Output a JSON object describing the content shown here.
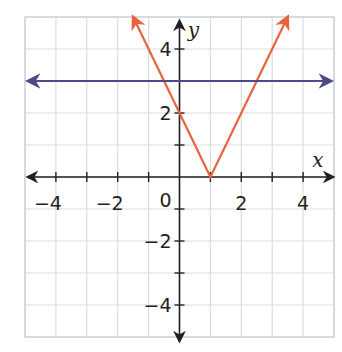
{
  "chart_data": {
    "type": "line",
    "title": "",
    "xlabel": "x",
    "ylabel": "y",
    "xlim": [
      -5,
      5
    ],
    "ylim": [
      -5,
      5
    ],
    "grid": true,
    "x_tick_labels": [
      {
        "value": -4,
        "label": "−4"
      },
      {
        "value": -2,
        "label": "−2"
      },
      {
        "value": 2,
        "label": "2"
      },
      {
        "value": 4,
        "label": "4"
      }
    ],
    "y_tick_labels": [
      {
        "value": 4,
        "label": "4"
      },
      {
        "value": 2,
        "label": "2"
      },
      {
        "value": -2,
        "label": "−2"
      },
      {
        "value": -4,
        "label": "−4"
      }
    ],
    "origin_label": "0",
    "series": [
      {
        "name": "y = 2|x - 1|",
        "kind": "absolute-value",
        "color": "#e8643a",
        "points": [
          [
            -1.5,
            5
          ],
          [
            1,
            0
          ],
          [
            3.5,
            5
          ]
        ],
        "arrows": [
          "start",
          "end"
        ]
      },
      {
        "name": "y = 3",
        "kind": "horizontal-line",
        "color": "#4a4a8c",
        "points": [
          [
            -4.9,
            3
          ],
          [
            4.9,
            3
          ]
        ],
        "arrows": [
          "start",
          "end"
        ]
      }
    ]
  },
  "colors": {
    "grid": "#d9dde3",
    "axis": "#231f20",
    "border": "#cfd4da"
  }
}
